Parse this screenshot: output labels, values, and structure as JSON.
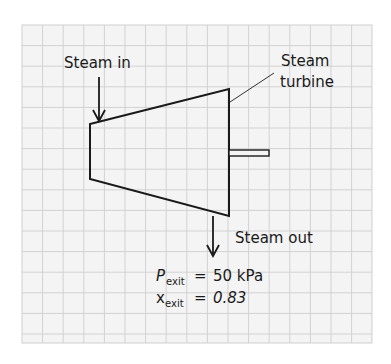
{
  "diagram": {
    "type": "steam-turbine-schematic",
    "colors": {
      "background": "#ffffff",
      "grid_fill": "#f4f4f4",
      "grid_line": "#cfcfcf",
      "stroke": "#1a1a1a"
    },
    "labels": {
      "steam_in": "Steam in",
      "turbine_line1": "Steam",
      "turbine_line2": "turbine",
      "steam_out": "Steam out"
    },
    "exit_conditions": {
      "pressure": {
        "symbol": "P",
        "subscript": "exit",
        "equals": "=",
        "value": "50 kPa"
      },
      "quality": {
        "symbol": "x",
        "subscript": "exit",
        "equals": "=",
        "value": "0.83"
      }
    }
  }
}
